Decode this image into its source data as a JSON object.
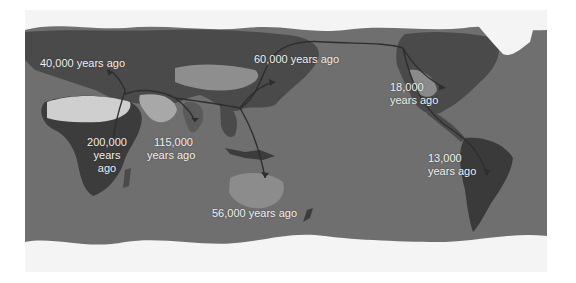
{
  "map": {
    "title": "Human migration routes",
    "style": "grayscale satellite world map, Pacific-centered",
    "colors": {
      "ocean": "#6f6f6f",
      "land_dark": "#3c3c3c",
      "land_mid": "#5a5a5a",
      "desert": "#c9c9c9",
      "ice": "#f4f4f4",
      "arrow": "#2e2e2e",
      "label_text": "#f2f2f2"
    },
    "labels": [
      {
        "id": "europe",
        "text": "40,000 years ago"
      },
      {
        "id": "east-asia",
        "text": "60,000 years ago"
      },
      {
        "id": "north-america-line1",
        "text": "18,000"
      },
      {
        "id": "north-america-line2",
        "text": "years ago"
      },
      {
        "id": "africa-line1",
        "text": "200,000"
      },
      {
        "id": "africa-line2",
        "text": "years"
      },
      {
        "id": "africa-line3",
        "text": "ago"
      },
      {
        "id": "south-asia-line1",
        "text": "115,000"
      },
      {
        "id": "south-asia-line2",
        "text": "years ago"
      },
      {
        "id": "south-america-line1",
        "text": "13,000"
      },
      {
        "id": "south-america-line2",
        "text": "years ago"
      },
      {
        "id": "australia",
        "text": "56,000 years ago"
      }
    ],
    "routes": [
      {
        "from": "East Africa",
        "to": "Europe"
      },
      {
        "from": "East Africa",
        "to": "Middle East / South Asia"
      },
      {
        "from": "South Asia",
        "to": "Australia"
      },
      {
        "from": "South Asia",
        "to": "East Asia"
      },
      {
        "from": "East Asia",
        "to": "Beringia / Alaska"
      },
      {
        "from": "Alaska",
        "to": "North America (east)"
      },
      {
        "from": "Alaska",
        "to": "South America"
      }
    ]
  }
}
